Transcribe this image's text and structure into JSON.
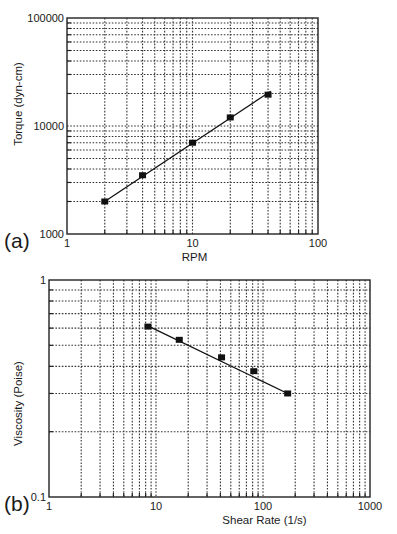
{
  "chart_data": [
    {
      "type": "line",
      "panel_label": "(a)",
      "title": "",
      "xlabel": "RPM",
      "ylabel": "Torque (dyn-cm)",
      "xscale": "log",
      "yscale": "log",
      "xlim": [
        1,
        100
      ],
      "ylim": [
        1000,
        100000
      ],
      "x_tick_labels": [
        "1",
        "10",
        "100"
      ],
      "y_tick_labels": [
        "1000",
        "10000",
        "100000"
      ],
      "grid": true,
      "legend": null,
      "marker": "square",
      "series": [
        {
          "name": "Torque",
          "x": [
            2,
            4,
            10,
            20,
            40
          ],
          "y": [
            2000,
            3500,
            7000,
            12000,
            19500
          ]
        }
      ],
      "fit_line": {
        "x": [
          2,
          42
        ],
        "y": [
          2000,
          21000
        ]
      },
      "layout": {
        "left": 67,
        "right": 318,
        "top": 18,
        "bottom": 234
      }
    },
    {
      "type": "line",
      "panel_label": "(b)",
      "title": "",
      "xlabel": "Shear Rate (1/s)",
      "ylabel": "Viscosity (Poise)",
      "xscale": "log",
      "yscale": "log",
      "xlim": [
        1,
        1000
      ],
      "ylim": [
        0.1,
        1
      ],
      "x_tick_labels": [
        "1",
        "10",
        "100",
        "1000"
      ],
      "y_tick_labels": [
        "0.1",
        "1"
      ],
      "grid": true,
      "legend": null,
      "marker": "square",
      "series": [
        {
          "name": "Viscosity",
          "x": [
            8.4,
            16.5,
            41,
            82,
            170
          ],
          "y": [
            0.61,
            0.53,
            0.44,
            0.38,
            0.3
          ]
        }
      ],
      "fit_line": {
        "x": [
          8.4,
          170
        ],
        "y": [
          0.615,
          0.3
        ]
      },
      "layout": {
        "left": 49,
        "right": 370,
        "top": 280,
        "bottom": 497
      }
    }
  ]
}
